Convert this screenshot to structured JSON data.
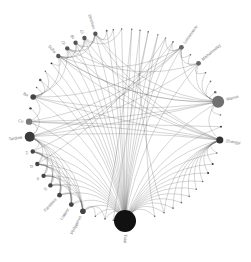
{
  "diagram": {
    "type": "circular-network",
    "center": [
      125,
      125
    ],
    "radius": 96,
    "colors": {
      "node": "#4a4a4a",
      "big_node": "#1a1a1a",
      "medium_node": "#6e6e6e",
      "edge": "#555555",
      "label": "#777777"
    },
    "nodes": [
      {
        "id": "Taiqi",
        "label": "Taiqi",
        "angle": 90,
        "r": 11,
        "color": "#111111",
        "label_side": "out"
      },
      {
        "id": "n_b1",
        "label": "",
        "angle": 72,
        "r": 0.8,
        "color": "#666666"
      },
      {
        "id": "n_b2",
        "label": "",
        "angle": 66,
        "r": 0.8,
        "color": "#666666"
      },
      {
        "id": "n_b3",
        "label": "",
        "angle": 60,
        "r": 0.8,
        "color": "#666666"
      },
      {
        "id": "n_b4",
        "label": "",
        "angle": 54,
        "r": 0.8,
        "color": "#666666"
      },
      {
        "id": "n_b5",
        "label": "",
        "angle": 48,
        "r": 0.8,
        "color": "#666666"
      },
      {
        "id": "n_b6",
        "label": "",
        "angle": 42,
        "r": 0.8,
        "color": "#666666"
      },
      {
        "id": "n_b7",
        "label": "",
        "angle": 36,
        "r": 0.8,
        "color": "#666666"
      },
      {
        "id": "n_b8",
        "label": "",
        "angle": 30,
        "r": 1.0,
        "color": "#333333"
      },
      {
        "id": "n_b9",
        "label": "",
        "angle": 24,
        "r": 1.0,
        "color": "#333333"
      },
      {
        "id": "n_b10",
        "label": "",
        "angle": 17,
        "r": 0.8,
        "color": "#666666"
      },
      {
        "id": "Zhangyi",
        "label": "Zhangyi",
        "angle": 9,
        "r": 3.5,
        "color": "#333333",
        "label_side": "out"
      },
      {
        "id": "n_r1",
        "label": "",
        "angle": 1,
        "r": 0.9,
        "color": "#222222"
      },
      {
        "id": "n_r2",
        "label": "",
        "angle": -6,
        "r": 0.8,
        "color": "#666666"
      },
      {
        "id": "Marius",
        "label": "Marius",
        "angle": -14,
        "r": 6,
        "color": "#707070",
        "label_side": "out"
      },
      {
        "id": "n_r3",
        "label": "",
        "angle": -20,
        "r": 1.2,
        "color": "#666666"
      },
      {
        "id": "n_r4",
        "label": "",
        "angle": -27,
        "r": 0.8,
        "color": "#666666"
      },
      {
        "id": "n_r5",
        "label": "",
        "angle": -33,
        "r": 0.8,
        "color": "#666666"
      },
      {
        "id": "Mikhailovsky",
        "label": "Mikhailovsky",
        "angle": -40,
        "r": 2.4,
        "color": "#666666",
        "label_side": "out"
      },
      {
        "id": "n_r6",
        "label": "",
        "angle": -47,
        "r": 0.8,
        "color": "#666666"
      },
      {
        "id": "Lomonosov",
        "label": "Lomonosov",
        "angle": -54,
        "r": 2.4,
        "color": "#666666",
        "label_side": "out"
      },
      {
        "id": "n_t1",
        "label": "",
        "angle": -60,
        "r": 0.8,
        "color": "#666666"
      },
      {
        "id": "n_t2",
        "label": "",
        "angle": -65,
        "r": 0.8,
        "color": "#888888"
      },
      {
        "id": "n_t3",
        "label": "",
        "angle": -70,
        "r": 0.8,
        "color": "#888888"
      },
      {
        "id": "n_t4",
        "label": "",
        "angle": -76,
        "r": 0.8,
        "color": "#666666"
      },
      {
        "id": "n_t5",
        "label": "",
        "angle": -81,
        "r": 0.8,
        "color": "#666666"
      },
      {
        "id": "n_t6",
        "label": "",
        "angle": -86,
        "r": 0.8,
        "color": "#666666"
      },
      {
        "id": "n_t7",
        "label": "",
        "angle": -92,
        "r": 0.8,
        "color": "#666666"
      },
      {
        "id": "n_t8",
        "label": "",
        "angle": -97,
        "r": 0.8,
        "color": "#666666"
      },
      {
        "id": "n_t9",
        "label": "",
        "angle": -101,
        "r": 1.0,
        "color": "#666666"
      },
      {
        "id": "Dimitrov",
        "label": "Dimitrov",
        "angle": -108,
        "r": 2.2,
        "color": "#555555",
        "label_side": "out"
      },
      {
        "id": "Ci",
        "label": "Ci",
        "angle": -115,
        "r": 2.2,
        "color": "#555555",
        "label_side": "out"
      },
      {
        "id": "Bi",
        "label": "Bi",
        "angle": -121,
        "r": 2.2,
        "color": "#555555",
        "label_side": "out"
      },
      {
        "id": "Oi",
        "label": "Oi",
        "angle": -127,
        "r": 2.2,
        "color": "#555555",
        "label_side": "out"
      },
      {
        "id": "Sofia",
        "label": "Sofia",
        "angle": -134,
        "r": 2.2,
        "color": "#555555",
        "label_side": "out"
      },
      {
        "id": "n_l1",
        "label": "",
        "angle": -140,
        "r": 0.9,
        "color": "#333333"
      },
      {
        "id": "n_l2",
        "label": "",
        "angle": -146,
        "r": 0.8,
        "color": "#666666"
      },
      {
        "id": "n_l3",
        "label": "",
        "angle": -152,
        "r": 1.3,
        "color": "#555555"
      },
      {
        "id": "n_l4",
        "label": "",
        "angle": -157,
        "r": 0.8,
        "color": "#666666"
      },
      {
        "id": "Bo",
        "label": "Bo",
        "angle": -163,
        "r": 2.8,
        "color": "#444444",
        "label_side": "out"
      },
      {
        "id": "n_l5",
        "label": "",
        "angle": -170,
        "r": 1.2,
        "color": "#444444"
      },
      {
        "id": "Cu",
        "label": "Cu",
        "angle": -178,
        "r": 3.2,
        "color": "#777777",
        "label_side": "out"
      },
      {
        "id": "Tardine",
        "label": "Tardine",
        "angle": 173,
        "r": 5,
        "color": "#3a3a3a",
        "label_side": "out"
      },
      {
        "id": "Z",
        "label": "Z",
        "angle": 164,
        "r": 2.2,
        "color": "#444444",
        "label_side": "out"
      },
      {
        "id": "D",
        "label": "D",
        "angle": 156,
        "r": 2.2,
        "color": "#444444",
        "label_side": "out"
      },
      {
        "id": "F",
        "label": "F",
        "angle": 148,
        "r": 2.2,
        "color": "#444444",
        "label_side": "out"
      },
      {
        "id": "S",
        "label": "S",
        "angle": 141,
        "r": 2.2,
        "color": "#444444",
        "label_side": "out"
      },
      {
        "id": "Fantaisie",
        "label": "Fantaisie",
        "angle": 133,
        "r": 2.4,
        "color": "#444444",
        "label_side": "out"
      },
      {
        "id": "Liabiez",
        "label": "Liabiez",
        "angle": 124,
        "r": 2.4,
        "color": "#444444",
        "label_side": "out"
      },
      {
        "id": "Philippines",
        "label": "Philippines",
        "angle": 116,
        "r": 2.8,
        "color": "#444444",
        "label_side": "out"
      },
      {
        "id": "n_bl1",
        "label": "",
        "angle": 108,
        "r": 0.8,
        "color": "#666666"
      },
      {
        "id": "n_bl2",
        "label": "",
        "angle": 102,
        "r": 0.8,
        "color": "#666666"
      },
      {
        "id": "n_bl3",
        "label": "",
        "angle": 97,
        "r": 0.8,
        "color": "#666666"
      }
    ],
    "edges": [
      [
        "Taiqi",
        "n_b1"
      ],
      [
        "Taiqi",
        "n_b2"
      ],
      [
        "Taiqi",
        "n_b3"
      ],
      [
        "Taiqi",
        "n_b4"
      ],
      [
        "Taiqi",
        "n_b5"
      ],
      [
        "Taiqi",
        "n_b6"
      ],
      [
        "Taiqi",
        "n_b7"
      ],
      [
        "Taiqi",
        "n_b8"
      ],
      [
        "Taiqi",
        "n_b9"
      ],
      [
        "Taiqi",
        "n_b10"
      ],
      [
        "Taiqi",
        "Zhangyi"
      ],
      [
        "Taiqi",
        "n_r1"
      ],
      [
        "Taiqi",
        "Marius"
      ],
      [
        "Taiqi",
        "Mikhailovsky"
      ],
      [
        "Taiqi",
        "Lomonosov"
      ],
      [
        "Taiqi",
        "n_t1"
      ],
      [
        "Taiqi",
        "n_t2"
      ],
      [
        "Taiqi",
        "n_t3"
      ],
      [
        "Taiqi",
        "n_t4"
      ],
      [
        "Taiqi",
        "n_t5"
      ],
      [
        "Taiqi",
        "n_t6"
      ],
      [
        "Taiqi",
        "n_t7"
      ],
      [
        "Taiqi",
        "n_t8"
      ],
      [
        "Taiqi",
        "n_t9"
      ],
      [
        "Taiqi",
        "Dimitrov"
      ],
      [
        "Taiqi",
        "Ci"
      ],
      [
        "Taiqi",
        "Bi"
      ],
      [
        "Taiqi",
        "Oi"
      ],
      [
        "Taiqi",
        "Sofia"
      ],
      [
        "Taiqi",
        "n_l1"
      ],
      [
        "Taiqi",
        "n_l2"
      ],
      [
        "Taiqi",
        "n_l3"
      ],
      [
        "Taiqi",
        "Bo"
      ],
      [
        "Taiqi",
        "Cu"
      ],
      [
        "Taiqi",
        "Tardine"
      ],
      [
        "Taiqi",
        "Z"
      ],
      [
        "Taiqi",
        "D"
      ],
      [
        "Taiqi",
        "F"
      ],
      [
        "Taiqi",
        "S"
      ],
      [
        "Taiqi",
        "Fantaisie"
      ],
      [
        "Taiqi",
        "Liabiez"
      ],
      [
        "Taiqi",
        "Philippines"
      ],
      [
        "Taiqi",
        "n_bl1"
      ],
      [
        "Taiqi",
        "n_bl2"
      ],
      [
        "Taiqi",
        "n_bl3"
      ],
      [
        "Zhangyi",
        "n_b5"
      ],
      [
        "Zhangyi",
        "n_b6"
      ],
      [
        "Zhangyi",
        "n_b7"
      ],
      [
        "Zhangyi",
        "n_b8"
      ],
      [
        "Zhangyi",
        "n_b9"
      ],
      [
        "Zhangyi",
        "n_b10"
      ],
      [
        "Zhangyi",
        "n_b4"
      ],
      [
        "Zhangyi",
        "n_b3"
      ],
      [
        "Zhangyi",
        "n_b2"
      ],
      [
        "Zhangyi",
        "Cu"
      ],
      [
        "Zhangyi",
        "Tardine"
      ],
      [
        "Zhangyi",
        "Marius"
      ],
      [
        "Marius",
        "n_r3"
      ],
      [
        "Marius",
        "n_r4"
      ],
      [
        "Marius",
        "n_r5"
      ],
      [
        "Marius",
        "Mikhailovsky"
      ],
      [
        "Marius",
        "Lomonosov"
      ],
      [
        "Marius",
        "n_r2"
      ],
      [
        "Marius",
        "Cu"
      ],
      [
        "Marius",
        "Sofia"
      ],
      [
        "Mikhailovsky",
        "n_r6"
      ],
      [
        "Mikhailovsky",
        "Lomonosov"
      ],
      [
        "Mikhailovsky",
        "n_r5"
      ],
      [
        "Mikhailovsky",
        "Tardine"
      ],
      [
        "Lomonosov",
        "n_t1"
      ],
      [
        "Lomonosov",
        "n_t2"
      ],
      [
        "Lomonosov",
        "n_r6"
      ],
      [
        "Lomonosov",
        "Tardine"
      ],
      [
        "Lomonosov",
        "Bo"
      ],
      [
        "Dimitrov",
        "Ci"
      ],
      [
        "Dimitrov",
        "Bi"
      ],
      [
        "Dimitrov",
        "Oi"
      ],
      [
        "Dimitrov",
        "Sofia"
      ],
      [
        "Dimitrov",
        "n_t9"
      ],
      [
        "Dimitrov",
        "n_t8"
      ],
      [
        "Dimitrov",
        "Zhangyi"
      ],
      [
        "Dimitrov",
        "Marius"
      ],
      [
        "Ci",
        "Bi"
      ],
      [
        "Ci",
        "Oi"
      ],
      [
        "Ci",
        "Sofia"
      ],
      [
        "Ci",
        "n_t7"
      ],
      [
        "Ci",
        "Zhangyi"
      ],
      [
        "Bi",
        "Oi"
      ],
      [
        "Bi",
        "Sofia"
      ],
      [
        "Bi",
        "Marius"
      ],
      [
        "Oi",
        "Sofia"
      ],
      [
        "Oi",
        "Bo"
      ],
      [
        "Oi",
        "Zhangyi"
      ],
      [
        "Sofia",
        "n_l1"
      ],
      [
        "Sofia",
        "Bo"
      ],
      [
        "Sofia",
        "Marius"
      ],
      [
        "Bo",
        "n_l2"
      ],
      [
        "Bo",
        "n_l3"
      ],
      [
        "Bo",
        "n_l4"
      ],
      [
        "Bo",
        "Cu"
      ],
      [
        "Bo",
        "Zhangyi"
      ],
      [
        "Bo",
        "Marius"
      ],
      [
        "Cu",
        "Tardine"
      ],
      [
        "Cu",
        "n_r1"
      ],
      [
        "Cu",
        "Lomonosov"
      ],
      [
        "Tardine",
        "Z"
      ],
      [
        "Tardine",
        "D"
      ],
      [
        "Tardine",
        "F"
      ],
      [
        "Tardine",
        "S"
      ],
      [
        "Tardine",
        "Fantaisie"
      ],
      [
        "Tardine",
        "Liabiez"
      ],
      [
        "Tardine",
        "Philippines"
      ],
      [
        "Tardine",
        "n_l5"
      ],
      [
        "Tardine",
        "Marius"
      ],
      [
        "Z",
        "D"
      ],
      [
        "Z",
        "F"
      ],
      [
        "Z",
        "S"
      ],
      [
        "Z",
        "Fantaisie"
      ],
      [
        "Z",
        "Liabiez"
      ],
      [
        "Z",
        "Philippines"
      ],
      [
        "D",
        "F"
      ],
      [
        "D",
        "S"
      ],
      [
        "D",
        "Fantaisie"
      ],
      [
        "D",
        "Liabiez"
      ],
      [
        "D",
        "Philippines"
      ],
      [
        "F",
        "S"
      ],
      [
        "F",
        "Fantaisie"
      ],
      [
        "F",
        "Liabiez"
      ],
      [
        "F",
        "Philippines"
      ],
      [
        "S",
        "Fantaisie"
      ],
      [
        "S",
        "Liabiez"
      ],
      [
        "S",
        "Philippines"
      ],
      [
        "Fantaisie",
        "Liabiez"
      ],
      [
        "Fantaisie",
        "Philippines"
      ],
      [
        "Liabiez",
        "Philippines"
      ],
      [
        "Philippines",
        "n_bl1"
      ],
      [
        "Philippines",
        "n_bl2"
      ],
      [
        "n_t3",
        "n_b1"
      ],
      [
        "n_t4",
        "n_bl3"
      ],
      [
        "n_t5",
        "n_b2"
      ],
      [
        "n_t6",
        "n_bl2"
      ],
      [
        "n_t1",
        "Z"
      ],
      [
        "n_t2",
        "D"
      ],
      [
        "Lomonosov",
        "Sofia"
      ],
      [
        "Mikhailovsky",
        "Oi"
      ],
      [
        "Zhangyi",
        "Sofia"
      ]
    ]
  }
}
